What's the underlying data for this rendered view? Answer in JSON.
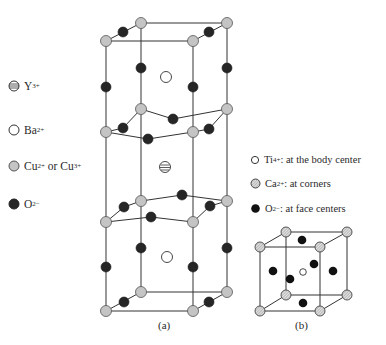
{
  "figure_a": {
    "caption": "(a)",
    "legend": [
      {
        "symbol": "striped-circle",
        "ion": "Y",
        "charge": "3+",
        "suffix": ""
      },
      {
        "symbol": "open-circle",
        "ion": "Ba",
        "charge": "2+",
        "suffix": ""
      },
      {
        "symbol": "gray-circle",
        "ion": "Cu",
        "charge": "2+",
        "suffix": " or Cu",
        "charge2": "3+"
      },
      {
        "symbol": "black-circle",
        "ion": "O",
        "charge": "2−",
        "suffix": ""
      }
    ]
  },
  "figure_b": {
    "caption": "(b)",
    "legend": [
      {
        "symbol": "open-circle",
        "ion": "Ti",
        "charge": "4+",
        "suffix": ": at the body center"
      },
      {
        "symbol": "hatched-circle",
        "ion": "Ca",
        "charge": "2+",
        "suffix": ": at corners"
      },
      {
        "symbol": "black-circle",
        "ion": "O",
        "charge": "2−",
        "suffix": ": at face centers"
      }
    ]
  },
  "colors": {
    "line": "#333333",
    "cu": "#c4c4c4",
    "oxygen": "#262626",
    "ba": "#ffffff",
    "ca": "#d0d0d0"
  }
}
